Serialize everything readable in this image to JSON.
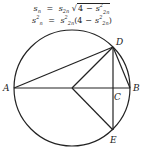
{
  "formulas": {
    "line1": {
      "lhs": "s",
      "lhs_sub": "n",
      "eq": "=",
      "rhs_s": "s",
      "rhs_sub": "2n",
      "sqrt": "√",
      "inner_const": "4",
      "minus": "−",
      "inner_s": "s",
      "inner_sub": "2n",
      "inner_sup": "2"
    },
    "line2": {
      "lhs": "s",
      "lhs_sub": "n",
      "lhs_sup": "2",
      "eq": "=",
      "rhs_s": "s",
      "rhs_sub": "2n",
      "rhs_sup": "2",
      "open": "(",
      "inner_const": "4",
      "minus": "−",
      "inner_s": "s",
      "inner_sub": "2n",
      "inner_sup": "2",
      "close": ")"
    }
  },
  "diagram": {
    "circle": {
      "cx": 72,
      "cy": 88,
      "r": 58
    },
    "points": {
      "A": {
        "label": "A",
        "x": 14,
        "y": 88
      },
      "B": {
        "label": "B",
        "x": 130,
        "y": 88
      },
      "C": {
        "label": "C",
        "x": 113,
        "y": 88
      },
      "D": {
        "label": "D",
        "x": 113,
        "y": 47
      },
      "E": {
        "label": "E",
        "x": 113,
        "y": 130
      },
      "O": {
        "label": "",
        "x": 72,
        "y": 88
      }
    },
    "stroke_color": "#222222"
  }
}
